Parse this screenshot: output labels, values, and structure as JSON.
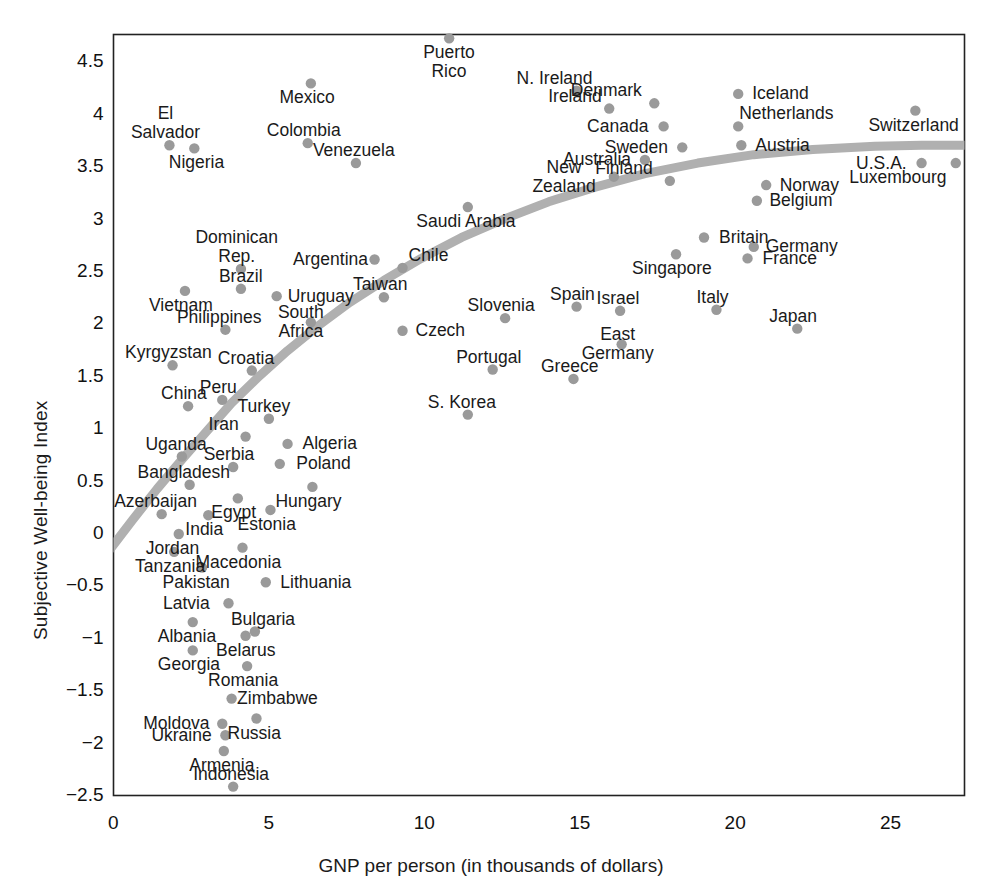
{
  "chart_data": {
    "type": "scatter",
    "title": "",
    "xlabel": "GNP per person (in thousands of dollars)",
    "ylabel": "Subjective Well-being Index",
    "xlim": [
      -0.3,
      27.4
    ],
    "ylim": [
      -2.5,
      4.88
    ],
    "xticks": [
      0,
      5,
      10,
      15,
      20,
      25
    ],
    "xtick_labels": [
      "0",
      "5",
      "10",
      "15",
      "20",
      "25"
    ],
    "yticks": [
      -2.5,
      -2,
      -1.5,
      -1,
      -0.5,
      0,
      0.5,
      1,
      1.5,
      2,
      2.5,
      3,
      3.5,
      4,
      4.5
    ],
    "ytick_labels": [
      "-2.5",
      "-2",
      "-1.5",
      "-1",
      "-0.5",
      "0",
      "0.5",
      "1",
      "1.5",
      "2",
      "2.5",
      "3",
      "3.5",
      "4",
      "4.5"
    ],
    "grid": false,
    "legend": "none",
    "point_color": "#9a9a9a",
    "trendline_color": "#b0b0b0",
    "axis_color": "#222222",
    "points": [
      {
        "name": "Puerto\nRico",
        "x": 10.8,
        "y": 4.72,
        "lx": 0,
        "ly": 18,
        "align": "center"
      },
      {
        "name": "N. Ireland",
        "x": 14.9,
        "y": 4.22,
        "lx": -22,
        "ly": -20,
        "align": "center"
      },
      {
        "name": "Mexico",
        "x": 6.35,
        "y": 4.29,
        "lx": -4,
        "ly": 16,
        "align": "center"
      },
      {
        "name": "Ireland",
        "x": 15.95,
        "y": 4.05,
        "lx": -34,
        "ly": -18,
        "align": "center"
      },
      {
        "name": "Denmark",
        "x": 17.4,
        "y": 4.1,
        "lx": -48,
        "ly": -19,
        "align": "center"
      },
      {
        "name": "Iceland",
        "x": 20.1,
        "y": 4.19,
        "lx": 42,
        "ly": -2,
        "align": "center"
      },
      {
        "name": "Switzerland",
        "x": 25.8,
        "y": 4.03,
        "lx": -2,
        "ly": 17,
        "align": "center"
      },
      {
        "name": "El\nSalvador",
        "x": 1.8,
        "y": 3.7,
        "lx": -4,
        "ly": -40,
        "align": "center"
      },
      {
        "name": "Colombia",
        "x": 6.25,
        "y": 3.72,
        "lx": -4,
        "ly": -20,
        "align": "center"
      },
      {
        "name": "Canada",
        "x": 17.7,
        "y": 3.88,
        "lx": -46,
        "ly": -2,
        "align": "center"
      },
      {
        "name": "Netherlands",
        "x": 20.1,
        "y": 3.88,
        "lx": 48,
        "ly": -19,
        "align": "center"
      },
      {
        "name": "Nigeria",
        "x": 2.6,
        "y": 3.67,
        "lx": 2,
        "ly": 17,
        "align": "center"
      },
      {
        "name": "Venezuela",
        "x": 7.8,
        "y": 3.53,
        "lx": -2,
        "ly": -19,
        "align": "center"
      },
      {
        "name": "Sweden",
        "x": 18.3,
        "y": 3.68,
        "lx": -46,
        "ly": -2,
        "align": "center"
      },
      {
        "name": "Austria",
        "x": 20.2,
        "y": 3.7,
        "lx": 41,
        "ly": -2,
        "align": "center"
      },
      {
        "name": "Australia",
        "x": 17.1,
        "y": 3.56,
        "lx": -48,
        "ly": -2,
        "align": "center"
      },
      {
        "name": "U.S.A.",
        "x": 26.0,
        "y": 3.53,
        "lx": -40,
        "ly": -1,
        "align": "center"
      },
      {
        "name": "Luxembourg",
        "x": 27.1,
        "y": 3.53,
        "lx": -58,
        "ly": 15,
        "align": "center"
      },
      {
        "name": "Finland",
        "x": 17.9,
        "y": 3.36,
        "lx": -46,
        "ly": -18,
        "align": "center"
      },
      {
        "name": "New\nZealand",
        "x": 16.1,
        "y": 3.4,
        "lx": -50,
        "ly": -12,
        "align": "center"
      },
      {
        "name": "Norway",
        "x": 21.0,
        "y": 3.32,
        "lx": 43,
        "ly": -2,
        "align": "center"
      },
      {
        "name": "Saudi Arabia",
        "x": 11.4,
        "y": 3.11,
        "lx": -2,
        "ly": 16,
        "align": "center"
      },
      {
        "name": "Belgium",
        "x": 20.7,
        "y": 3.17,
        "lx": 44,
        "ly": 0,
        "align": "center"
      },
      {
        "name": "Britain",
        "x": 19.0,
        "y": 2.82,
        "lx": 40,
        "ly": -2,
        "align": "center"
      },
      {
        "name": "Dominican\nRep.",
        "x": 4.1,
        "y": 2.52,
        "lx": -4,
        "ly": -42,
        "align": "center"
      },
      {
        "name": "Argentina",
        "x": 8.4,
        "y": 2.61,
        "lx": -44,
        "ly": -2,
        "align": "center"
      },
      {
        "name": "Chile",
        "x": 9.3,
        "y": 2.53,
        "lx": 26,
        "ly": -20,
        "align": "center"
      },
      {
        "name": "Germany",
        "x": 20.6,
        "y": 2.73,
        "lx": 48,
        "ly": 1,
        "align": "center"
      },
      {
        "name": "Singapore",
        "x": 18.1,
        "y": 2.66,
        "lx": -4,
        "ly": 16,
        "align": "center"
      },
      {
        "name": "France",
        "x": 20.4,
        "y": 2.62,
        "lx": 42,
        "ly": 0,
        "align": "center"
      },
      {
        "name": "Brazil",
        "x": 4.1,
        "y": 2.33,
        "lx": 0,
        "ly": -20,
        "align": "center"
      },
      {
        "name": "Vietnam",
        "x": 2.3,
        "y": 2.31,
        "lx": -4,
        "ly": 16,
        "align": "center"
      },
      {
        "name": "Taiwan",
        "x": 8.7,
        "y": 2.25,
        "lx": -4,
        "ly": -19,
        "align": "center"
      },
      {
        "name": "Uruguay",
        "x": 5.25,
        "y": 2.26,
        "lx": 44,
        "ly": 0,
        "align": "center"
      },
      {
        "name": "Spain",
        "x": 14.9,
        "y": 2.16,
        "lx": -4,
        "ly": -19,
        "align": "center"
      },
      {
        "name": "Slovenia",
        "x": 12.6,
        "y": 2.05,
        "lx": -4,
        "ly": -19,
        "align": "center"
      },
      {
        "name": "Israel",
        "x": 16.3,
        "y": 2.12,
        "lx": -2,
        "ly": -19,
        "align": "center"
      },
      {
        "name": "Italy",
        "x": 19.4,
        "y": 2.13,
        "lx": -4,
        "ly": -19,
        "align": "center"
      },
      {
        "name": "Philippines",
        "x": 3.6,
        "y": 1.94,
        "lx": -6,
        "ly": -19,
        "align": "center"
      },
      {
        "name": "South\nAfrica",
        "x": 6.35,
        "y": 2.01,
        "lx": -10,
        "ly": -12,
        "align": "center"
      },
      {
        "name": "Czech",
        "x": 9.3,
        "y": 1.93,
        "lx": 38,
        "ly": -1,
        "align": "center"
      },
      {
        "name": "East\nGermany",
        "x": 16.35,
        "y": 1.8,
        "lx": -4,
        "ly": -2,
        "align": "center"
      },
      {
        "name": "Japan",
        "x": 22.0,
        "y": 1.95,
        "lx": -4,
        "ly": -19,
        "align": "center"
      },
      {
        "name": "Kyrgyzstan",
        "x": 1.9,
        "y": 1.6,
        "lx": -4,
        "ly": -19,
        "align": "center"
      },
      {
        "name": "Croatia",
        "x": 4.45,
        "y": 1.55,
        "lx": -6,
        "ly": -19,
        "align": "center"
      },
      {
        "name": "Portugal",
        "x": 12.2,
        "y": 1.56,
        "lx": -4,
        "ly": -19,
        "align": "center"
      },
      {
        "name": "Greece",
        "x": 14.8,
        "y": 1.47,
        "lx": -4,
        "ly": -19,
        "align": "center"
      },
      {
        "name": "Peru",
        "x": 3.5,
        "y": 1.27,
        "lx": -4,
        "ly": -19,
        "align": "center"
      },
      {
        "name": "China",
        "x": 2.4,
        "y": 1.21,
        "lx": -4,
        "ly": -19,
        "align": "center"
      },
      {
        "name": "S. Korea",
        "x": 11.4,
        "y": 1.13,
        "lx": -6,
        "ly": -19,
        "align": "center"
      },
      {
        "name": "Turkey",
        "x": 5.0,
        "y": 1.09,
        "lx": -5,
        "ly": -19,
        "align": "center"
      },
      {
        "name": "Iran",
        "x": 4.25,
        "y": 0.92,
        "lx": -22,
        "ly": -19,
        "align": "center"
      },
      {
        "name": "Algeria",
        "x": 5.6,
        "y": 0.85,
        "lx": 42,
        "ly": 0,
        "align": "center"
      },
      {
        "name": "Uganda",
        "x": 2.2,
        "y": 0.73,
        "lx": -6,
        "ly": -19,
        "align": "center"
      },
      {
        "name": "Poland",
        "x": 5.35,
        "y": 0.66,
        "lx": 44,
        "ly": 0,
        "align": "center"
      },
      {
        "name": "Serbia",
        "x": 3.85,
        "y": 0.63,
        "lx": -4,
        "ly": -19,
        "align": "center"
      },
      {
        "name": "Bangladesh",
        "x": 2.45,
        "y": 0.46,
        "lx": -6,
        "ly": -19,
        "align": "center"
      },
      {
        "name": "Hungary",
        "x": 6.4,
        "y": 0.44,
        "lx": -4,
        "ly": 16,
        "align": "center"
      },
      {
        "name": "Egypt",
        "x": 4.0,
        "y": 0.33,
        "lx": -4,
        "ly": 16,
        "align": "center"
      },
      {
        "name": "Azerbaijan",
        "x": 1.55,
        "y": 0.18,
        "lx": -6,
        "ly": -19,
        "align": "center"
      },
      {
        "name": "India",
        "x": 3.05,
        "y": 0.17,
        "lx": -4,
        "ly": 16,
        "align": "center"
      },
      {
        "name": "Estonia",
        "x": 5.05,
        "y": 0.22,
        "lx": -4,
        "ly": 16,
        "align": "center"
      },
      {
        "name": "Jordan",
        "x": 2.1,
        "y": -0.01,
        "lx": -6,
        "ly": 16,
        "align": "center"
      },
      {
        "name": "Tanzania",
        "x": 1.95,
        "y": -0.18,
        "lx": -4,
        "ly": 16,
        "align": "center"
      },
      {
        "name": "Macedonia",
        "x": 4.15,
        "y": -0.14,
        "lx": -4,
        "ly": 16,
        "align": "center"
      },
      {
        "name": "Pakistan",
        "x": 2.85,
        "y": -0.33,
        "lx": -6,
        "ly": 16,
        "align": "center"
      },
      {
        "name": "Lithuania",
        "x": 4.9,
        "y": -0.47,
        "lx": 50,
        "ly": 1,
        "align": "center"
      },
      {
        "name": "Latvia",
        "x": 3.7,
        "y": -0.67,
        "lx": -42,
        "ly": -1,
        "align": "center"
      },
      {
        "name": "Bulgaria",
        "x": 4.55,
        "y": -0.94,
        "lx": 8,
        "ly": -19,
        "align": "center"
      },
      {
        "name": "Albania",
        "x": 2.55,
        "y": -0.85,
        "lx": -6,
        "ly": 16,
        "align": "center"
      },
      {
        "name": "Belarus",
        "x": 4.25,
        "y": -0.98,
        "lx": 0,
        "ly": 16,
        "align": "center"
      },
      {
        "name": "Georgia",
        "x": 2.55,
        "y": -1.12,
        "lx": -4,
        "ly": 16,
        "align": "center"
      },
      {
        "name": "Romania",
        "x": 4.3,
        "y": -1.27,
        "lx": -4,
        "ly": 16,
        "align": "center"
      },
      {
        "name": "Zimbabwe",
        "x": 3.8,
        "y": -1.58,
        "lx": 46,
        "ly": 1,
        "align": "center"
      },
      {
        "name": "Moldova",
        "x": 3.5,
        "y": -1.82,
        "lx": -46,
        "ly": -1,
        "align": "center"
      },
      {
        "name": "Russia",
        "x": 4.6,
        "y": -1.77,
        "lx": -2,
        "ly": 16,
        "align": "center"
      },
      {
        "name": "Ukraine",
        "x": 3.6,
        "y": -1.93,
        "lx": -44,
        "ly": 0,
        "align": "center"
      },
      {
        "name": "Armenia",
        "x": 3.55,
        "y": -2.08,
        "lx": -2,
        "ly": 16,
        "align": "center"
      },
      {
        "name": "Indonesia",
        "x": 3.85,
        "y": -2.42,
        "lx": -2,
        "ly": -19,
        "align": "center"
      }
    ],
    "trendline": {
      "description": "Fitted logarithmic trend of well-being vs GNP per person",
      "points": [
        [
          -0.25,
          -0.21
        ],
        [
          0.6,
          0.12
        ],
        [
          1.4,
          0.42
        ],
        [
          2.2,
          0.7
        ],
        [
          3.0,
          0.97
        ],
        [
          3.8,
          1.24
        ],
        [
          4.7,
          1.5
        ],
        [
          5.6,
          1.74
        ],
        [
          6.6,
          1.98
        ],
        [
          7.6,
          2.2
        ],
        [
          8.7,
          2.41
        ],
        [
          9.9,
          2.62
        ],
        [
          11.2,
          2.82
        ],
        [
          12.6,
          3.0
        ],
        [
          14.0,
          3.16
        ],
        [
          15.5,
          3.3
        ],
        [
          17.1,
          3.43
        ],
        [
          18.8,
          3.53
        ],
        [
          20.6,
          3.61
        ],
        [
          22.5,
          3.66
        ],
        [
          24.5,
          3.69
        ],
        [
          26.0,
          3.7
        ],
        [
          27.4,
          3.7
        ]
      ]
    }
  }
}
